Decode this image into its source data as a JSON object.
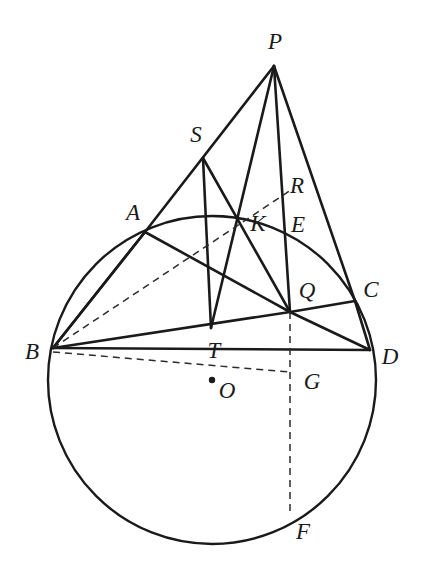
{
  "figure": {
    "stroke_color": "#1a1a1a",
    "dash_color": "#2b2b2b",
    "background": "#ffffff",
    "solid_stroke_width": 2.6,
    "circle_stroke_width": 2.4,
    "dash_stroke_width": 1.5,
    "dash_pattern": "7,5"
  },
  "circle": {
    "center_label": "O",
    "cx": 212,
    "cy": 380,
    "r": 164
  },
  "points": [
    {
      "id": "P",
      "label": "P",
      "x": 274,
      "y": 66,
      "label_x": 275,
      "label_y": 41,
      "dot": false
    },
    {
      "id": "S",
      "label": "S",
      "x": 203,
      "y": 158,
      "label_x": 196,
      "label_y": 134,
      "dot": false
    },
    {
      "id": "A",
      "label": "A",
      "x": 145,
      "y": 232,
      "label_x": 133,
      "label_y": 212,
      "dot": false
    },
    {
      "id": "R",
      "label": "R",
      "x": 292,
      "y": 190,
      "label_x": 297,
      "label_y": 185,
      "dot": false
    },
    {
      "id": "K",
      "label": "K",
      "x": 237,
      "y": 221,
      "label_x": 258,
      "label_y": 223,
      "dot": false
    },
    {
      "id": "E",
      "label": "E",
      "x": 288,
      "y": 226,
      "label_x": 298,
      "label_y": 224,
      "dot": false
    },
    {
      "id": "Q",
      "label": "Q",
      "x": 290,
      "y": 312,
      "label_x": 307,
      "label_y": 290,
      "dot": false
    },
    {
      "id": "C",
      "label": "C",
      "x": 355,
      "y": 301,
      "label_x": 371,
      "label_y": 289,
      "dot": false
    },
    {
      "id": "B",
      "label": "B",
      "x": 53,
      "y": 348,
      "label_x": 32,
      "label_y": 351,
      "dot": false
    },
    {
      "id": "T",
      "label": "T",
      "x": 211,
      "y": 328,
      "label_x": 214,
      "label_y": 350,
      "dot": false
    },
    {
      "id": "D",
      "label": "D",
      "x": 370,
      "y": 350,
      "label_x": 390,
      "label_y": 356,
      "dot": false
    },
    {
      "id": "G",
      "label": "G",
      "x": 290,
      "y": 380,
      "label_x": 312,
      "label_y": 381,
      "dot": false
    },
    {
      "id": "O",
      "label": "O",
      "x": 212,
      "y": 380,
      "label_x": 227,
      "label_y": 390,
      "dot": true
    },
    {
      "id": "F",
      "label": "F",
      "x": 290,
      "y": 516,
      "label_x": 303,
      "label_y": 531,
      "dot": false
    }
  ],
  "solid_segments": [
    {
      "name": "P-to-A",
      "x1": 274,
      "y1": 66,
      "x2": 145,
      "y2": 232
    },
    {
      "name": "A-to-B",
      "x1": 145,
      "y1": 232,
      "x2": 53,
      "y2": 348
    },
    {
      "name": "P-to-T",
      "x1": 274,
      "y1": 66,
      "x2": 211,
      "y2": 328
    },
    {
      "name": "P-to-Q",
      "x1": 274,
      "y1": 66,
      "x2": 290,
      "y2": 312
    },
    {
      "name": "P-to-C",
      "x1": 274,
      "y1": 66,
      "x2": 355,
      "y2": 301
    },
    {
      "name": "C-to-D",
      "x1": 355,
      "y1": 301,
      "x2": 370,
      "y2": 350
    },
    {
      "name": "S-to-T",
      "x1": 203,
      "y1": 158,
      "x2": 211,
      "y2": 328
    },
    {
      "name": "S-to-Q",
      "x1": 203,
      "y1": 158,
      "x2": 290,
      "y2": 312
    },
    {
      "name": "B-to-D",
      "x1": 53,
      "y1": 348,
      "x2": 370,
      "y2": 350
    },
    {
      "name": "A-to-Q",
      "x1": 145,
      "y1": 232,
      "x2": 290,
      "y2": 312
    },
    {
      "name": "Q-to-C",
      "x1": 290,
      "y1": 312,
      "x2": 355,
      "y2": 301
    },
    {
      "name": "B-to-Q",
      "x1": 53,
      "y1": 348,
      "x2": 290,
      "y2": 312
    },
    {
      "name": "Q-to-D",
      "x1": 290,
      "y1": 312,
      "x2": 370,
      "y2": 350
    },
    {
      "name": "B-to-A-upper",
      "x1": 53,
      "y1": 348,
      "x2": 145,
      "y2": 232
    }
  ],
  "dashed_segments": [
    {
      "name": "B-to-R-through-K",
      "x1": 53,
      "y1": 348,
      "x2": 294,
      "y2": 188
    },
    {
      "name": "B-to-G-through-O",
      "x1": 53,
      "y1": 352,
      "x2": 290,
      "y2": 372
    },
    {
      "name": "Q-to-F-vertical",
      "x1": 290,
      "y1": 312,
      "x2": 290,
      "y2": 516
    }
  ]
}
